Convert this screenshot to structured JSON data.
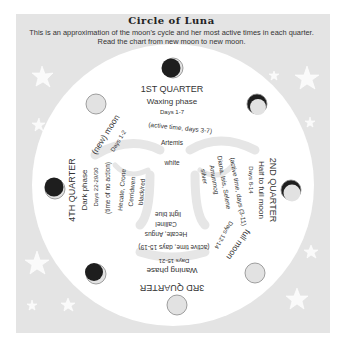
{
  "header": {
    "title": "Circle of Luna",
    "subtitle_line1": "This is an approximation of the moon's cycle and her most active times in each quarter.",
    "subtitle_line2": "Read the chart from new moon to new moon."
  },
  "colors": {
    "panel": "#e4e4e4",
    "circle": "#ffffff",
    "moon_dark": "#1e1e1e",
    "moon_light": "#e2e2e2",
    "text": "#333333",
    "faint_text": "#777777"
  },
  "quarters": {
    "first": {
      "heading": "1ST QUARTER",
      "phase": "Waxing phase",
      "days": "Days 1-7",
      "active": "(active time, days 3-7)",
      "deity": "Artemis",
      "color": "white"
    },
    "second": {
      "heading": "2ND QUARTER",
      "phase": "Half to full moon",
      "days": "Days 8-14",
      "active": "(active time, days (3-11)",
      "deity": "Diana, Isis, Selene",
      "deity2": "Amunmog",
      "color": "silver"
    },
    "full": {
      "heading": "full moon",
      "days": "Days 12-14"
    },
    "third": {
      "heading": "3RD QUARTER",
      "phase": "Waning phase",
      "days": "Days 15-21",
      "active": "(active time, days 15-19)",
      "deity": "Hecate, Angus",
      "deity2": "Callinel",
      "color": "light blue"
    },
    "fourth": {
      "heading": "4TH QUARTER",
      "phase": "Dark phase",
      "days": "Days 22-29/30",
      "active": "(time of no action)",
      "deity": "Hecate, Crone",
      "deity2": "Cerridwen",
      "color": "black/red"
    },
    "new": {
      "heading": "(new) moon",
      "days": "Days 1-2"
    }
  },
  "moons": [
    {
      "name": "new-moon-top",
      "phase": "dark-with-right-sliver"
    },
    {
      "name": "waxing-crescent-topright",
      "phase": "crescent-dark-top"
    },
    {
      "name": "first-quarter-right",
      "phase": "light-with-dark-top-edge"
    },
    {
      "name": "full-moon-bottomright",
      "phase": "full"
    },
    {
      "name": "full-moon-bottom",
      "phase": "full"
    },
    {
      "name": "waning-bottomleft",
      "phase": "dark-with-light-edge"
    },
    {
      "name": "dark-moon-left",
      "phase": "dark"
    },
    {
      "name": "full-topleft",
      "phase": "full"
    }
  ]
}
